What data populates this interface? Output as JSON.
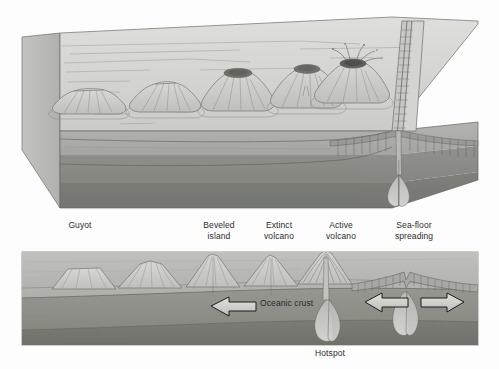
{
  "figure": {
    "title_alt": "Sea-floor spreading and hotspot volcanic island chain",
    "background_color": "#fdfdfd"
  },
  "palette": {
    "water_top": "#d8d9d6",
    "water_top_2": "#cfd0cd",
    "block_front_upper": "#a9aaa6",
    "block_front_mid": "#8e8f8b",
    "block_front_lower": "#7d7e7a",
    "block_side": "#bdbeba",
    "crust_light": "#b6b7b3",
    "mantle_dark": "#8a8b86",
    "mantle_darker": "#74756f",
    "volcano_fill": "#cbccc8",
    "volcano_line": "#6d6e69",
    "crater_dark": "#6f7069",
    "arrow_fill": "#cfd0cb",
    "arrow_stroke": "#1d1d1b",
    "outline": "#5f605b",
    "label_color": "#2b2b2b",
    "magma": "#c6c7c2"
  },
  "top_panel": {
    "name": "perspective-block-diagram",
    "features": [
      {
        "id": "guyot",
        "kind": "flat-topped-seamount"
      },
      {
        "id": "beveled-island",
        "kind": "eroded-volcano"
      },
      {
        "id": "extinct-volcano",
        "kind": "cone-with-crater"
      },
      {
        "id": "extinct-volcano-2",
        "kind": "cone-with-crater"
      },
      {
        "id": "active-volcano",
        "kind": "erupting-cone"
      },
      {
        "id": "mid-ocean-ridge",
        "kind": "spreading-ridge-with-rift-valley"
      }
    ]
  },
  "labels": {
    "guyot": "Guyot",
    "beveled_island": "Beveled\nisland",
    "extinct_volcano": "Extinct\nvolcano",
    "active_volcano": "Active\nvolcano",
    "sea_floor_spreading": "Sea-floor\nspreading",
    "oceanic_crust": "Oceanic crust",
    "hotspot": "Hotspot"
  },
  "bottom_panel": {
    "name": "cross-section-diagram",
    "features": [
      {
        "id": "guyot-section",
        "kind": "flat-topped-seamount"
      },
      {
        "id": "beveled-island-section",
        "kind": "eroded-volcano"
      },
      {
        "id": "extinct-volcano-section",
        "kind": "cone"
      },
      {
        "id": "extinct-volcano-2-section",
        "kind": "cone"
      },
      {
        "id": "active-volcano-section",
        "kind": "erupting-cone-with-conduit"
      },
      {
        "id": "ridge-axis",
        "kind": "rift-valley"
      },
      {
        "id": "magma-chamber-left",
        "kind": "rising-magma-plume"
      },
      {
        "id": "magma-chamber-right",
        "kind": "rising-magma-plume"
      }
    ],
    "arrows": [
      {
        "id": "plate-motion-left",
        "direction": "left",
        "label_ref": "oceanic_crust"
      },
      {
        "id": "spreading-left",
        "direction": "left"
      },
      {
        "id": "spreading-right",
        "direction": "right"
      }
    ],
    "layers": [
      {
        "id": "oceanic-crust-layer",
        "tone": "light"
      },
      {
        "id": "upper-mantle-layer",
        "tone": "medium"
      },
      {
        "id": "lower-mantle-layer",
        "tone": "dark"
      }
    ]
  }
}
